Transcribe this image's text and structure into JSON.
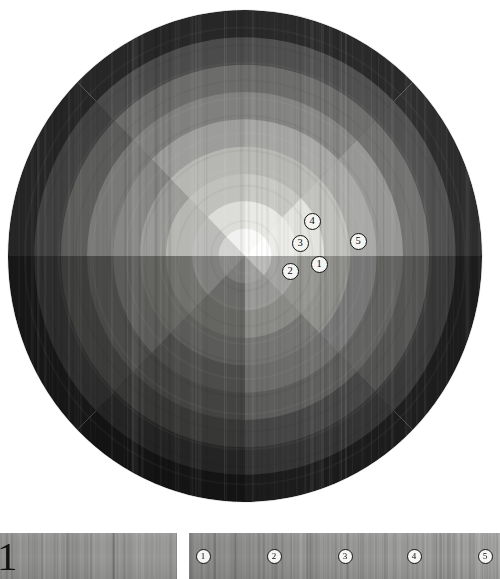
{
  "figure": {
    "type": "polar-grayscale-sector-map",
    "background": "#ffffff"
  },
  "polar": {
    "center_x": 245,
    "center_y": 256,
    "radius_x": 237,
    "radius_y": 246,
    "n_sectors": 8,
    "n_rings": 9,
    "sector_start_deg": -90,
    "ring_gray_levels": [
      "#fafaf8",
      "#e2e2df",
      "#cfcfcb",
      "#b9b9b5",
      "#a2a2a0",
      "#8a8a88",
      "#6e6e6d",
      "#4e4e4e",
      "#2b2b2b"
    ],
    "sector_modulation": [
      1.0,
      1.06,
      0.8,
      0.72,
      0.58,
      0.66,
      0.9,
      1.02
    ],
    "quadrant_shade": {
      "top_left": 0.9,
      "top_right": 1.0,
      "bottom_left": 0.7,
      "bottom_right": 0.86
    }
  },
  "markers": [
    {
      "label": "1",
      "x": 319,
      "y": 264
    },
    {
      "label": "2",
      "x": 290,
      "y": 271
    },
    {
      "label": "3",
      "x": 300,
      "y": 243
    },
    {
      "label": "4",
      "x": 312,
      "y": 221
    },
    {
      "label": "5",
      "x": 358,
      "y": 241
    }
  ],
  "strips": {
    "left": {
      "label": "1",
      "x": 0,
      "y": 533,
      "width": 177,
      "height": 46,
      "gray_start": "#8f8f8d",
      "gray_end": "#9b9b99",
      "markers": []
    },
    "right": {
      "x": 189,
      "y": 533,
      "width": 311,
      "height": 46,
      "gray_start": "#8a8a88",
      "gray_end": "#a3a3a1",
      "markers": [
        {
          "label": "1",
          "x": 203
        },
        {
          "label": "2",
          "x": 274
        },
        {
          "label": "3",
          "x": 345
        },
        {
          "label": "4",
          "x": 414
        },
        {
          "label": "5",
          "x": 485
        }
      ]
    }
  },
  "colors": {
    "marker_fill": "#f4f4f2",
    "marker_stroke": "#111111",
    "text": "#0a0a0a",
    "background": "#ffffff"
  }
}
